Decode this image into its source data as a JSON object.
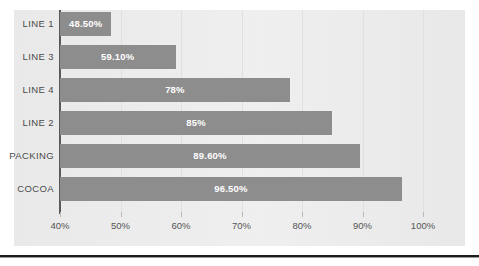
{
  "chart_data": {
    "type": "bar",
    "orientation": "horizontal",
    "title": "",
    "xlabel": "",
    "ylabel": "",
    "categories": [
      "LINE 1",
      "LINE 3",
      "LINE 4",
      "LINE 2",
      "PACKING",
      "COCOA"
    ],
    "values": [
      48.5,
      59.1,
      78,
      85,
      89.6,
      96.5
    ],
    "value_labels": [
      "48.50%",
      "59.10%",
      "78%",
      "85%",
      "89.60%",
      "96.50%"
    ],
    "xlim": [
      40,
      100
    ],
    "x_ticks": [
      40,
      50,
      60,
      70,
      80,
      90,
      100
    ],
    "x_tick_labels": [
      "40%",
      "50%",
      "60%",
      "70%",
      "80%",
      "90%",
      "100%"
    ],
    "grid": true,
    "legend": false,
    "series": [
      {
        "name": "",
        "values": [
          48.5,
          59.1,
          78,
          85,
          89.6,
          96.5
        ]
      }
    ]
  },
  "colors": {
    "bar": "#8d8d8d",
    "panel_background": "#ececec",
    "axis_line": "#59595b",
    "gridline": "#e0e0e0",
    "value_label_text": "#ffffff",
    "category_label_text": "#4a4a4a",
    "tick_label_text": "#555555",
    "bottom_rule": "#1c1c1c"
  }
}
